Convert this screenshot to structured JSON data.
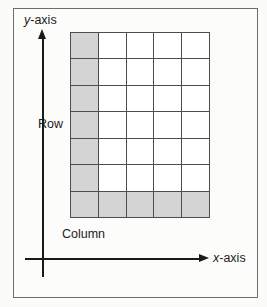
{
  "figure": {
    "type": "grid-coordinate-diagram",
    "background_color": "#fcfcfb",
    "frame_color": "#6e6e6e"
  },
  "axes": {
    "y": {
      "label_italic": "y",
      "label_rest": "-axis",
      "arrow": "up-arrow-icon"
    },
    "x": {
      "label_italic": "x",
      "label_rest": "-axis",
      "arrow": "right-arrow-icon"
    },
    "axis_color": "#1a1a1a"
  },
  "labels": {
    "row": "Row",
    "column": "Column"
  },
  "grid": {
    "columns": 5,
    "rows": 7,
    "line_color": "#4d4d4d",
    "cell_color": "#ffffff",
    "shaded_color": "#d4d4d4",
    "shaded_column_index": 0,
    "shaded_row_index": 6,
    "cells": [
      [
        "shaded",
        "empty",
        "empty",
        "empty",
        "empty"
      ],
      [
        "shaded",
        "empty",
        "empty",
        "empty",
        "empty"
      ],
      [
        "shaded",
        "empty",
        "empty",
        "empty",
        "empty"
      ],
      [
        "shaded",
        "empty",
        "empty",
        "empty",
        "empty"
      ],
      [
        "shaded",
        "empty",
        "empty",
        "empty",
        "empty"
      ],
      [
        "shaded",
        "empty",
        "empty",
        "empty",
        "empty"
      ],
      [
        "shaded",
        "shaded",
        "shaded",
        "shaded",
        "shaded"
      ]
    ]
  }
}
